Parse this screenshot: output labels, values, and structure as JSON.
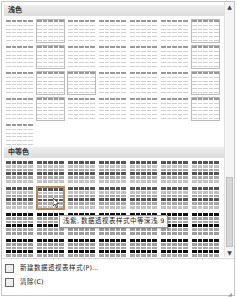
{
  "gallery": {
    "sections": [
      {
        "label": "浅色",
        "rows": 5,
        "cols": 7,
        "count": 29,
        "tone": "light"
      },
      {
        "label": "中等色",
        "rows": 4,
        "cols": 7,
        "count": 28,
        "tone": "medium"
      }
    ],
    "selected_style": {
      "section": "中等色",
      "row": 2,
      "col": 2
    },
    "tooltip": "浅紫, 数据透视表样式中等深浅 9"
  },
  "scrollbar": {
    "up": "▲",
    "down": "▼"
  },
  "footer": {
    "items": [
      {
        "label": "新建数据透视表样式(P)...",
        "icon": "new-style-icon"
      },
      {
        "label": "清除(C)",
        "icon": "clear-icon"
      }
    ]
  },
  "colors": {
    "selected_border": "#b38a5c",
    "header_bg": "#e4e4e4"
  }
}
